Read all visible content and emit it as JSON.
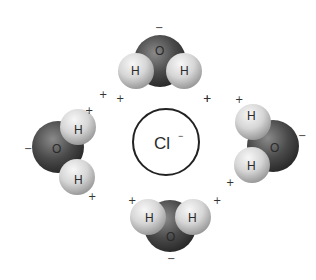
{
  "diagram": {
    "center_ion": {
      "symbol": "Cl",
      "charge": "−"
    },
    "atom_labels": {
      "oxygen": "O",
      "hydrogen": "H"
    },
    "partial_charges": {
      "positive": "+",
      "negative": "−"
    },
    "molecules": [
      {
        "id": "top",
        "oxygen": "O",
        "hydrogens": [
          "H",
          "H"
        ],
        "negative_sign": "−",
        "positive_signs": [
          "+",
          "+"
        ]
      },
      {
        "id": "left",
        "oxygen": "O",
        "hydrogens": [
          "H",
          "H"
        ],
        "negative_sign": "−",
        "positive_signs": [
          "+",
          "+",
          "+"
        ]
      },
      {
        "id": "right",
        "oxygen": "O",
        "hydrogens": [
          "H",
          "H"
        ],
        "negative_sign": "−",
        "positive_signs": [
          "+",
          "+",
          "+"
        ]
      },
      {
        "id": "bottom",
        "oxygen": "O",
        "hydrogens": [
          "H",
          "H"
        ],
        "negative_sign": "−",
        "positive_signs": [
          "+",
          "+"
        ]
      }
    ],
    "colors": {
      "oxygen_dark": "#2b2b2b",
      "oxygen_light": "#8a8a8a",
      "hydrogen_light": "#f2f2f2",
      "hydrogen_dark": "#9a9a9a",
      "ion_outline": "#222222"
    }
  }
}
